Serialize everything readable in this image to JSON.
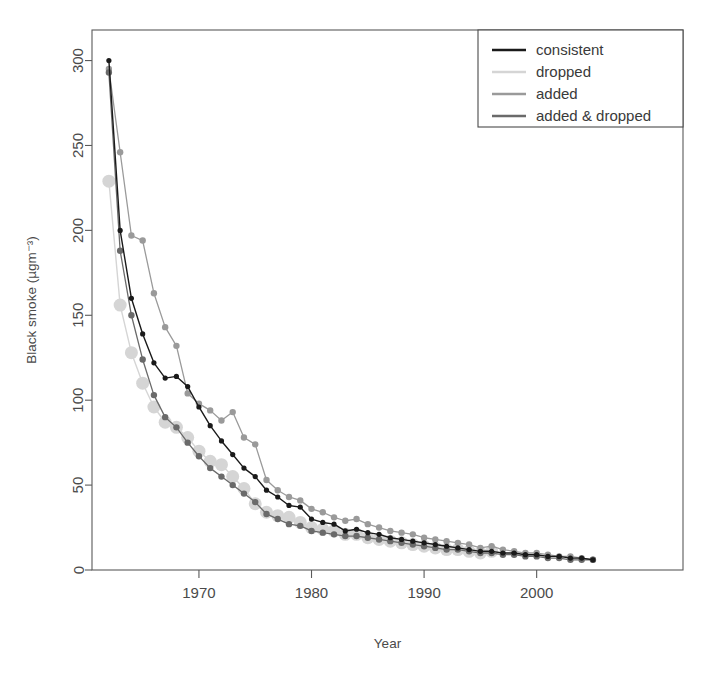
{
  "chart_data": {
    "type": "line",
    "title": "",
    "xlabel": "Year",
    "ylabel": "Black smoke (µgm⁻³)",
    "xlim": [
      1960.5,
      2013.0
    ],
    "ylim": [
      0,
      318
    ],
    "xticks": [
      1970,
      1980,
      1990,
      2000
    ],
    "xticklabels": [
      "1970",
      "1980",
      "1990",
      "2000"
    ],
    "yticks": [
      0,
      50,
      100,
      150,
      200,
      250,
      300
    ],
    "yticklabels": [
      "0",
      "50",
      "100",
      "150",
      "200",
      "250",
      "300"
    ],
    "grid": false,
    "legend_position": "top-right",
    "series": [
      {
        "name": "consistent",
        "color": "#1a1a1a",
        "marker": "circle-small",
        "x": [
          1962,
          1963,
          1964,
          1965,
          1966,
          1967,
          1968,
          1969,
          1970,
          1971,
          1972,
          1973,
          1974,
          1975,
          1976,
          1977,
          1978,
          1979,
          1980,
          1981,
          1982,
          1983,
          1984,
          1985,
          1986,
          1987,
          1988,
          1989,
          1990,
          1991,
          1992,
          1993,
          1994,
          1995,
          1996,
          1997,
          1998,
          1999,
          2000,
          2001,
          2002,
          2003,
          2004,
          2005
        ],
        "values": [
          300,
          200,
          160,
          139,
          122,
          113,
          114,
          108,
          96,
          85,
          76,
          68,
          60,
          55,
          47,
          43,
          38,
          37,
          30,
          28,
          27,
          23,
          24,
          22,
          21,
          19,
          18,
          17,
          16,
          15,
          14,
          13,
          12,
          11,
          11,
          10,
          10,
          9,
          9,
          8,
          8,
          7,
          7,
          6
        ]
      },
      {
        "name": "dropped",
        "color": "#d5d5d5",
        "marker": "circle-large",
        "x": [
          1962,
          1963,
          1964,
          1965,
          1966,
          1967,
          1968,
          1969,
          1970,
          1971,
          1972,
          1973,
          1974,
          1975,
          1976,
          1977,
          1978,
          1979,
          1980,
          1981,
          1982,
          1983,
          1984,
          1985,
          1986,
          1987,
          1988,
          1989,
          1990,
          1991,
          1992,
          1993,
          1994,
          1995,
          1996
        ],
        "values": [
          229,
          156,
          128,
          110,
          96,
          87,
          84,
          78,
          70,
          64,
          62,
          55,
          48,
          39,
          34,
          32,
          31,
          28,
          25,
          24,
          23,
          21,
          21,
          19,
          18,
          17,
          16,
          15,
          14,
          13,
          12,
          12,
          11,
          10,
          11
        ]
      },
      {
        "name": "added",
        "color": "#9a9a9a",
        "marker": "circle-med",
        "x": [
          1962,
          1963,
          1964,
          1965,
          1966,
          1967,
          1968,
          1969,
          1970,
          1971,
          1972,
          1973,
          1974,
          1975,
          1976,
          1977,
          1978,
          1979,
          1980,
          1981,
          1982,
          1983,
          1984,
          1985,
          1986,
          1987,
          1988,
          1989,
          1990,
          1991,
          1992,
          1993,
          1994,
          1995,
          1996,
          1997,
          1998,
          1999,
          2000,
          2001,
          2002,
          2003,
          2004,
          2005
        ],
        "values": [
          295,
          246,
          197,
          194,
          163,
          143,
          132,
          104,
          98,
          94,
          88,
          93,
          78,
          74,
          53,
          47,
          43,
          41,
          36,
          34,
          31,
          29,
          30,
          27,
          25,
          23,
          22,
          21,
          19,
          18,
          17,
          16,
          15,
          13,
          14,
          12,
          11,
          10,
          10,
          9,
          8,
          8,
          7,
          6
        ]
      },
      {
        "name": "added & dropped",
        "color": "#6a6a6a",
        "marker": "circle-med",
        "x": [
          1962,
          1963,
          1964,
          1965,
          1966,
          1967,
          1968,
          1969,
          1970,
          1971,
          1972,
          1973,
          1974,
          1975,
          1976,
          1977,
          1978,
          1979,
          1980,
          1981,
          1982,
          1983,
          1984,
          1985,
          1986,
          1987,
          1988,
          1989,
          1990,
          1991,
          1992,
          1993,
          1994,
          1995,
          1996,
          1997,
          1998,
          1999,
          2000,
          2001,
          2002,
          2003,
          2004,
          2005
        ],
        "values": [
          293,
          188,
          150,
          124,
          103,
          90,
          84,
          75,
          67,
          60,
          55,
          50,
          45,
          40,
          33,
          30,
          27,
          26,
          23,
          22,
          21,
          20,
          20,
          19,
          18,
          17,
          16,
          15,
          14,
          13,
          12,
          12,
          11,
          10,
          10,
          9,
          9,
          8,
          8,
          7,
          7,
          6,
          6,
          6
        ]
      }
    ]
  },
  "legend": {
    "items": [
      {
        "label": "consistent",
        "color": "#1a1a1a"
      },
      {
        "label": "dropped",
        "color": "#d5d5d5"
      },
      {
        "label": "added",
        "color": "#9a9a9a"
      },
      {
        "label": "added & dropped",
        "color": "#6a6a6a"
      }
    ]
  }
}
